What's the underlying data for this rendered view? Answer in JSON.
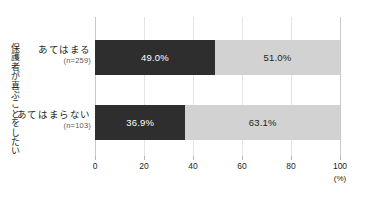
{
  "chart_data": {
    "type": "bar",
    "orientation": "horizontal",
    "stacked": true,
    "title": "",
    "xlabel": "(%)",
    "ylabel": "保護者が喜ぶことをしたい",
    "categories": [
      "あてはまる",
      "あてはまらない"
    ],
    "category_counts": [
      "(n=259)",
      "(n=103)"
    ],
    "xlim": [
      0,
      100
    ],
    "xticks": [
      0,
      20,
      40,
      60,
      80,
      100
    ],
    "xtick_labels": [
      "0",
      "20",
      "40",
      "60",
      "80",
      "100"
    ],
    "grid": true,
    "legend": "none",
    "series": [
      {
        "name": "dark",
        "color": "#2e2e2e",
        "values": [
          49.0,
          36.9
        ],
        "labels": [
          "49.0%",
          "36.9%"
        ]
      },
      {
        "name": "light",
        "color": "#d2d2d2",
        "values": [
          51.0,
          63.1
        ],
        "labels": [
          "51.0%",
          "63.1%"
        ]
      }
    ]
  },
  "axis": {
    "unit": "(%)",
    "y_title": "保護者が喜ぶことをしたい"
  },
  "rows": [
    {
      "label": "あてはまる",
      "n": "(n=259)",
      "dark_label": "49.0%",
      "light_label": "51.0%",
      "dark_value": 49.0,
      "light_value": 51.0
    },
    {
      "label": "あてはまらない",
      "n": "(n=103)",
      "dark_label": "36.9%",
      "light_label": "63.1%",
      "dark_value": 36.9,
      "light_value": 63.1
    }
  ],
  "ticks": [
    {
      "label": "0",
      "value": 0
    },
    {
      "label": "20",
      "value": 20
    },
    {
      "label": "40",
      "value": 40
    },
    {
      "label": "60",
      "value": 60
    },
    {
      "label": "80",
      "value": 80
    },
    {
      "label": "100",
      "value": 100
    }
  ],
  "colors": {
    "dark": "#2e2e2e",
    "light": "#d2d2d2",
    "grid": "#e4e4e4",
    "axis": "#c9c9c9",
    "text": "#231f20"
  }
}
